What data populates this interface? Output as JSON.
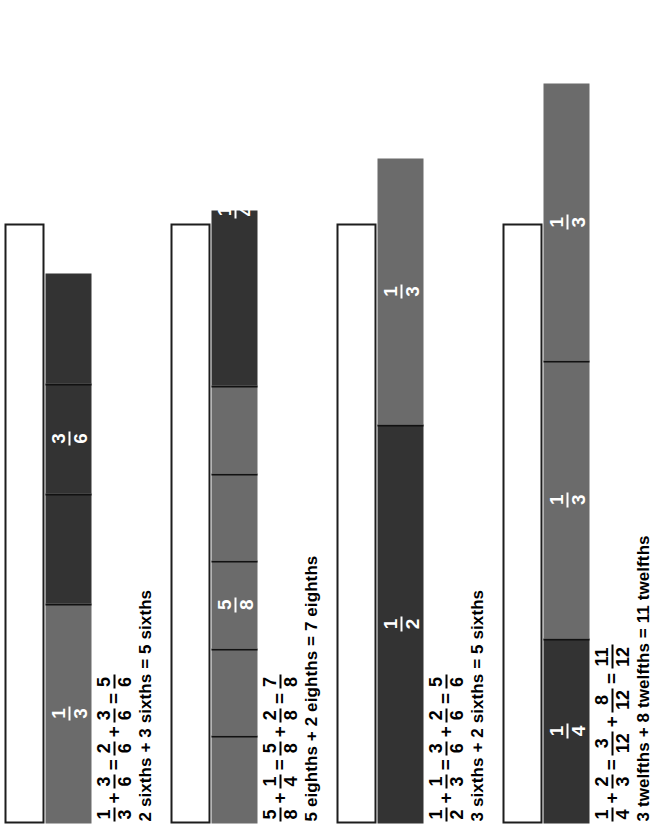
{
  "page": {
    "colors": {
      "gray_segment": "#6b6b6b",
      "dark_segment": "#333333",
      "outline": "#1d1d1d",
      "label_text": "#ffffff",
      "body_text": "#000000",
      "background": "#ffffff"
    }
  },
  "examples": [
    {
      "id": "example-1",
      "whole_bar_width": 600,
      "bar": {
        "total_width": 660,
        "segments": [
          {
            "shade": "gray",
            "width": 220,
            "group": "a"
          },
          {
            "shade": "dark",
            "width": 110,
            "group": "b"
          },
          {
            "shade": "dark",
            "width": 110,
            "group": "b"
          },
          {
            "shade": "dark",
            "width": 110,
            "group": "b"
          }
        ],
        "group_labels": [
          {
            "group": "a",
            "num": "1",
            "den": "3",
            "start": 0,
            "width": 220
          },
          {
            "group": "b",
            "num": "3",
            "den": "6",
            "start": 220,
            "width": 330
          }
        ]
      },
      "equation": [
        {
          "type": "frac",
          "num": "1",
          "den": "3"
        },
        {
          "type": "op",
          "text": "+"
        },
        {
          "type": "frac",
          "num": "3",
          "den": "6"
        },
        {
          "type": "op",
          "text": "="
        },
        {
          "type": "frac",
          "num": "2",
          "den": "6"
        },
        {
          "type": "op",
          "text": "+"
        },
        {
          "type": "frac",
          "num": "3",
          "den": "6"
        },
        {
          "type": "op",
          "text": "="
        },
        {
          "type": "frac",
          "num": "5",
          "den": "6"
        }
      ],
      "sentence": "2 sixths + 3 sixths = 5 sixths"
    },
    {
      "id": "example-2",
      "whole_bar_width": 600,
      "bar": {
        "total_width": 700,
        "segments": [
          {
            "shade": "gray",
            "width": 87.5,
            "group": "a"
          },
          {
            "shade": "gray",
            "width": 87.5,
            "group": "a"
          },
          {
            "shade": "gray",
            "width": 87.5,
            "group": "a"
          },
          {
            "shade": "gray",
            "width": 87.5,
            "group": "a"
          },
          {
            "shade": "gray",
            "width": 87.5,
            "group": "a"
          },
          {
            "shade": "dark",
            "width": 175,
            "group": "b"
          }
        ],
        "group_labels": [
          {
            "group": "a",
            "num": "5",
            "den": "8",
            "start": 0,
            "width": 437.5
          },
          {
            "group": "b",
            "num": "1",
            "den": "4",
            "start": 525,
            "width": 175
          }
        ]
      },
      "equation": [
        {
          "type": "frac",
          "num": "5",
          "den": "8"
        },
        {
          "type": "op",
          "text": "+"
        },
        {
          "type": "frac",
          "num": "1",
          "den": "4"
        },
        {
          "type": "op",
          "text": "="
        },
        {
          "type": "frac",
          "num": "5",
          "den": "8"
        },
        {
          "type": "op",
          "text": "+"
        },
        {
          "type": "frac",
          "num": "2",
          "den": "8"
        },
        {
          "type": "op",
          "text": "="
        },
        {
          "type": "frac",
          "num": "7",
          "den": "8"
        }
      ],
      "sentence": "5 eighths + 2 eighths = 7 eighths"
    },
    {
      "id": "example-3",
      "whole_bar_width": 600,
      "bar": {
        "total_width": 665,
        "segments": [
          {
            "shade": "dark",
            "width": 399,
            "group": "a"
          },
          {
            "shade": "gray",
            "width": 266,
            "group": "b"
          }
        ],
        "group_labels": [
          {
            "group": "a",
            "num": "1",
            "den": "2",
            "start": 0,
            "width": 399
          },
          {
            "group": "b",
            "num": "1",
            "den": "3",
            "start": 399,
            "width": 266
          }
        ]
      },
      "equation": [
        {
          "type": "frac",
          "num": "1",
          "den": "2"
        },
        {
          "type": "op",
          "text": "+"
        },
        {
          "type": "frac",
          "num": "1",
          "den": "3"
        },
        {
          "type": "op",
          "text": "="
        },
        {
          "type": "frac",
          "num": "3",
          "den": "6"
        },
        {
          "type": "op",
          "text": "+"
        },
        {
          "type": "frac",
          "num": "2",
          "den": "6"
        },
        {
          "type": "op",
          "text": "="
        },
        {
          "type": "frac",
          "num": "5",
          "den": "6"
        }
      ],
      "sentence": "3 sixths + 2 sixths = 5 sixths"
    },
    {
      "id": "example-4",
      "whole_bar_width": 600,
      "bar": {
        "total_width": 740,
        "segments": [
          {
            "shade": "dark",
            "width": 185,
            "group": "a"
          },
          {
            "shade": "gray",
            "width": 277.5,
            "group": "b"
          },
          {
            "shade": "gray",
            "width": 277.5,
            "group": "c"
          }
        ],
        "group_labels": [
          {
            "group": "a",
            "num": "1",
            "den": "4",
            "start": 0,
            "width": 185
          },
          {
            "group": "b",
            "num": "1",
            "den": "3",
            "start": 185,
            "width": 277.5
          },
          {
            "group": "c",
            "num": "1",
            "den": "3",
            "start": 462.5,
            "width": 277.5
          }
        ]
      },
      "equation": [
        {
          "type": "frac",
          "num": "1",
          "den": "4"
        },
        {
          "type": "op",
          "text": "+"
        },
        {
          "type": "frac",
          "num": "2",
          "den": "3"
        },
        {
          "type": "op",
          "text": "="
        },
        {
          "type": "frac",
          "num": "3",
          "den": "12"
        },
        {
          "type": "op",
          "text": "+"
        },
        {
          "type": "frac",
          "num": "8",
          "den": "12"
        },
        {
          "type": "op",
          "text": "="
        },
        {
          "type": "frac",
          "num": "11",
          "den": "12"
        }
      ],
      "sentence": "3 twelfths + 8 twelfths = 11 twelfths"
    }
  ]
}
